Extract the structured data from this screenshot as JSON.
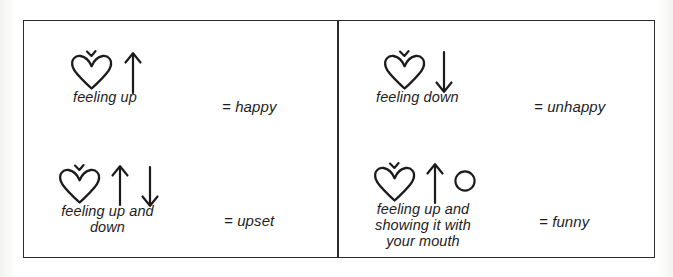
{
  "figure": {
    "background_color": "#ffffff",
    "ink_color": "#1b1b1b",
    "frame": {
      "border_color": "#2b2b2b",
      "has_vertical_divider": true
    }
  },
  "entries": [
    {
      "id": "happy",
      "position": "top-left",
      "glyphs": [
        "heart-with-caret-icon",
        "up-arrow-icon"
      ],
      "caption": "feeling up",
      "equals_sign": "=",
      "meaning": "happy"
    },
    {
      "id": "unhappy",
      "position": "top-right",
      "glyphs": [
        "heart-with-caret-icon",
        "down-arrow-icon"
      ],
      "caption": "feeling down",
      "equals_sign": "=",
      "meaning": "unhappy"
    },
    {
      "id": "upset",
      "position": "bottom-left",
      "glyphs": [
        "heart-with-caret-icon",
        "up-arrow-icon",
        "down-arrow-icon"
      ],
      "caption": "feeling up and\ndown",
      "equals_sign": "=",
      "meaning": "upset"
    },
    {
      "id": "funny",
      "position": "bottom-right",
      "glyphs": [
        "heart-with-caret-icon",
        "up-arrow-icon",
        "circle-mouth-icon"
      ],
      "caption": "feeling up and\nshowing it with\nyour mouth",
      "equals_sign": "=",
      "meaning": "funny"
    }
  ]
}
